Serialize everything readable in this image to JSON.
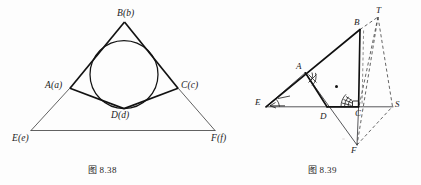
{
  "page": {
    "background": "#fdfdfd",
    "ink": "#1b1b1b",
    "width": 421,
    "height": 185
  },
  "figures": [
    {
      "id": "figure-8-38",
      "caption_prefix": "图",
      "caption_number": "8.38",
      "caption": "图 8.38",
      "description": "Triangle ABC with inscribed circle tangent to AC at D; rays from A and C extended to meet line EF at E and F",
      "vertex_labels": [
        {
          "key": "B",
          "text": "B(b)",
          "x": 120,
          "y": 9
        },
        {
          "key": "A",
          "text": "A(a)",
          "x": 48,
          "y": 81
        },
        {
          "key": "C",
          "text": "C(c)",
          "x": 183,
          "y": 81
        },
        {
          "key": "D",
          "text": "D(d)",
          "x": 113,
          "y": 111
        },
        {
          "key": "E",
          "text": "E(e)",
          "x": 14,
          "y": 134
        },
        {
          "key": "F",
          "text": "F(f)",
          "x": 212,
          "y": 134
        }
      ],
      "geometry": {
        "triangle": [
          [
            124,
            22
          ],
          [
            70,
            88
          ],
          [
            178,
            88
          ]
        ],
        "incircle": {
          "cx": 124,
          "cy": 74,
          "r": 34
        },
        "tangent_point_D": [
          124,
          108
        ],
        "point_E": [
          32,
          130
        ],
        "point_F": [
          214,
          130
        ],
        "thin_rays": [
          [
            [
              70,
              88
            ],
            [
              32,
              130
            ]
          ],
          [
            [
              178,
              88
            ],
            [
              214,
              130
            ]
          ],
          [
            [
              32,
              130
            ],
            [
              214,
              130
            ]
          ]
        ]
      }
    },
    {
      "id": "figure-8-39",
      "caption_prefix": "图",
      "caption_number": "8.39",
      "caption": "图 8.39",
      "description": "Triangle EBF with inner triangle ABCD construction, centroid dot, marked equal angles at A, E and C, right angle at C, and dashed lines to auxiliary points S and T",
      "vertex_labels": [
        {
          "key": "T",
          "text": "T",
          "x": 376,
          "y": 6
        },
        {
          "key": "B",
          "text": "B",
          "x": 353,
          "y": 19
        },
        {
          "key": "A",
          "text": "A",
          "x": 296,
          "y": 63
        },
        {
          "key": "E",
          "text": "E",
          "x": 256,
          "y": 98
        },
        {
          "key": "D",
          "text": "D",
          "x": 320,
          "y": 115
        },
        {
          "key": "C",
          "text": "C",
          "x": 355,
          "y": 112
        },
        {
          "key": "S",
          "text": "S",
          "x": 395,
          "y": 100
        },
        {
          "key": "F",
          "text": "F",
          "x": 351,
          "y": 148
        }
      ],
      "geometry": {
        "point_T": [
          378,
          16
        ],
        "point_B": [
          360,
          29
        ],
        "point_A": [
          305,
          73
        ],
        "point_E": [
          266,
          107
        ],
        "point_D": [
          327,
          107
        ],
        "point_C": [
          358,
          107
        ],
        "point_S": [
          393,
          107
        ],
        "point_F": [
          357,
          146
        ],
        "centroid_dot": [
          336,
          86
        ],
        "bold_edges": [
          [
            [
              266,
              107
            ],
            [
              360,
              29
            ]
          ],
          [
            [
              360,
              29
            ],
            [
              358,
              107
            ]
          ],
          [
            [
              305,
              73
            ],
            [
              327,
              107
            ]
          ],
          [
            [
              327,
              107
            ],
            [
              358,
              107
            ]
          ]
        ],
        "thin_edges": [
          [
            [
              266,
              107
            ],
            [
              393,
              107
            ]
          ],
          [
            [
              305,
              73
            ],
            [
              357,
              146
            ]
          ],
          [
            [
              358,
              107
            ],
            [
              357,
              146
            ]
          ],
          [
            [
              266,
              107
            ],
            [
              305,
              73
            ]
          ]
        ],
        "dashed_edges": [
          [
            [
              360,
              29
            ],
            [
              378,
              16
            ]
          ],
          [
            [
              378,
              16
            ],
            [
              393,
              107
            ]
          ],
          [
            [
              378,
              16
            ],
            [
              357,
              146
            ]
          ],
          [
            [
              358,
              107
            ],
            [
              378,
              16
            ]
          ],
          [
            [
              357,
              146
            ],
            [
              393,
              107
            ]
          ]
        ]
      },
      "angle_marks": [
        {
          "at": "A",
          "type": "double-arc-hatched"
        },
        {
          "at": "E",
          "type": "arc-with-arrow"
        },
        {
          "at": "C",
          "type": "triple-arc-hatched"
        },
        {
          "at": "C",
          "type": "right-angle-square"
        }
      ]
    }
  ]
}
